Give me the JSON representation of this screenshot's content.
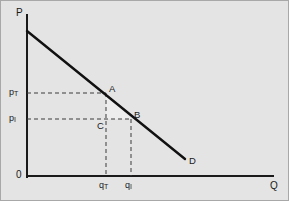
{
  "figure": {
    "background_color": "#e4e4e4",
    "border_color": "#a8a8a8",
    "axis_color": "#1a1a1a",
    "curve_color": "#111111",
    "shade_color": "#eeeeee"
  },
  "axes": {
    "y_axis_label": "P",
    "x_axis_label": "Q",
    "origin_label": "0"
  },
  "price_ticks": [
    {
      "label": "pT",
      "base": "p",
      "sub": "T"
    },
    {
      "label": "pI",
      "base": "p",
      "sub": "I"
    }
  ],
  "quantity_ticks": [
    {
      "label": "qT",
      "base": "q",
      "sub": "T"
    },
    {
      "label": "qI",
      "base": "q",
      "sub": "I"
    }
  ],
  "points": [
    {
      "label": "A"
    },
    {
      "label": "B"
    },
    {
      "label": "C"
    }
  ],
  "curve": {
    "label": "D"
  },
  "chart_data": {
    "type": "line",
    "title": "",
    "xlabel": "Q",
    "ylabel": "P",
    "grid": false,
    "legend": "none",
    "series": [
      {
        "name": "D",
        "type": "line",
        "points": [
          {
            "x": 0,
            "y": 145
          },
          {
            "x": 160,
            "y": 17
          }
        ],
        "label": "D"
      }
    ],
    "annotated_points": [
      {
        "label": "A",
        "x": 80,
        "y": 83,
        "note": "on demand curve at price pT, quantity qT"
      },
      {
        "label": "B",
        "x": 105,
        "y": 57,
        "note": "on demand curve at price pI, quantity qI"
      },
      {
        "label": "C",
        "x": 80,
        "y": 57,
        "note": "corner at price pI, quantity qT"
      }
    ],
    "shaded_region": {
      "vertices": [
        "A",
        "C",
        "B"
      ],
      "type": "triangle",
      "note": "deadweight-loss triangle between the two price levels"
    },
    "price_levels": [
      {
        "label": "pT",
        "y": 83
      },
      {
        "label": "pI",
        "y": 57
      }
    ],
    "quantity_levels": [
      {
        "label": "qT",
        "x": 80
      },
      {
        "label": "qI",
        "x": 105
      }
    ],
    "xlim": [
      0,
      250
    ],
    "ylim": [
      0,
      165
    ]
  }
}
